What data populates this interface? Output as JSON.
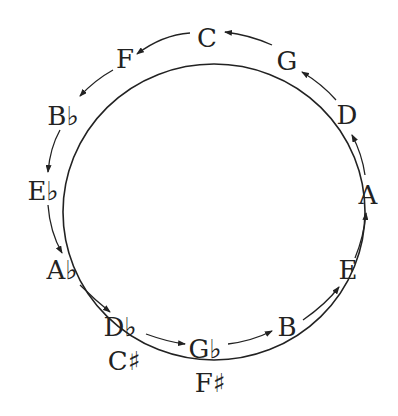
{
  "diagram": {
    "colors": {
      "ink": "#222222",
      "background": "#ffffff"
    },
    "notes": [
      {
        "id": "C",
        "label": "C",
        "x": 207,
        "y": 47
      },
      {
        "id": "G",
        "label": "G",
        "x": 287,
        "y": 70
      },
      {
        "id": "D",
        "label": "D",
        "x": 347,
        "y": 124
      },
      {
        "id": "A",
        "label": "A",
        "x": 368,
        "y": 204
      },
      {
        "id": "E",
        "label": "E",
        "x": 348,
        "y": 279
      },
      {
        "id": "B",
        "label": "B",
        "x": 287,
        "y": 336
      },
      {
        "id": "Gb",
        "label": "G♭",
        "x": 205,
        "y": 358,
        "enharmonic": "F♯"
      },
      {
        "id": "Db",
        "label": "D♭",
        "x": 120,
        "y": 336,
        "enharmonic": "C♯"
      },
      {
        "id": "Ab",
        "label": "A♭",
        "x": 62,
        "y": 279
      },
      {
        "id": "Eb",
        "label": "E♭",
        "x": 43,
        "y": 200
      },
      {
        "id": "Bb",
        "label": "B♭",
        "x": 63,
        "y": 125
      },
      {
        "id": "F",
        "label": "F",
        "x": 125,
        "y": 68
      }
    ],
    "enharmonics": [
      {
        "of": "Db",
        "label": "C♯",
        "x": 124,
        "y": 370
      },
      {
        "of": "Gb",
        "label": "F♯",
        "x": 210,
        "y": 392
      }
    ],
    "arrow_sequence": [
      "B",
      "E",
      "A",
      "D",
      "G",
      "C",
      "F",
      "Bb",
      "Eb",
      "Ab",
      "Db",
      "Gb",
      "B"
    ],
    "direction": "counterclockwise"
  }
}
